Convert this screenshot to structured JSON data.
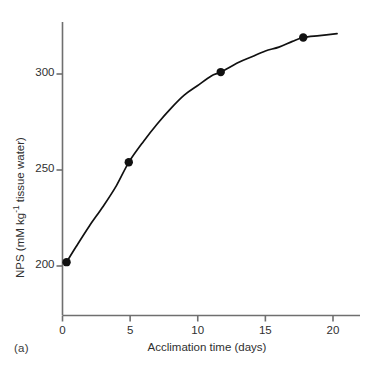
{
  "figure": {
    "panel_label": "(a)",
    "background_color": "#ffffff",
    "axis_color": "#6f6f6f",
    "data_color": "#111111"
  },
  "chart_data": {
    "type": "line",
    "title": "",
    "subtitle": "",
    "xlabel": "Acclimation time (days)",
    "ylabel_text": "NPS (mM kg",
    "ylabel_sup": "-1",
    "ylabel_tail": " tissue water)",
    "ylabel": "NPS (mM kg-1 tissue water)",
    "xlim": [
      -0.4,
      22.0
    ],
    "ylim": [
      176,
      330
    ],
    "xticks": [
      0,
      5,
      10,
      15,
      20
    ],
    "xtick_labels": [
      "0",
      "5",
      "10",
      "15",
      "20"
    ],
    "yticks": [
      200,
      250,
      300
    ],
    "ytick_labels": [
      "200",
      "250",
      "300"
    ],
    "grid": false,
    "legend": null,
    "x": [
      0.3,
      4.9,
      11.7,
      17.8
    ],
    "values": [
      202,
      254,
      301,
      319
    ],
    "series": [
      {
        "name": "NPS",
        "marker": "filled-circle",
        "marker_size": 6,
        "x": [
          0.3,
          4.9,
          11.7,
          17.8
        ],
        "values": [
          202,
          254,
          301,
          319
        ]
      }
    ],
    "fit_curve": {
      "description": "saturating rise to plateau through the four points",
      "x": [
        0.3,
        1.0,
        2.0,
        3.0,
        4.0,
        4.9,
        6.0,
        7.0,
        8.0,
        9.0,
        10.0,
        11.0,
        11.7,
        13.0,
        14.0,
        15.0,
        16.0,
        17.0,
        17.8,
        19.0,
        20.3
      ],
      "y": [
        202,
        210,
        221,
        231,
        242,
        254,
        265,
        274,
        282,
        289,
        294,
        299,
        301,
        306,
        309,
        312,
        314,
        317,
        319,
        320,
        321
      ]
    },
    "annotations": [
      "(a)"
    ]
  }
}
